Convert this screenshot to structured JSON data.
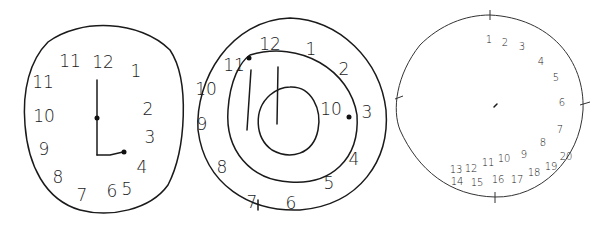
{
  "figure": {
    "clocks": [
      {
        "label": "clock-1",
        "numbers": [
          "12",
          "1",
          "2",
          "3",
          "4",
          "5",
          "6",
          "7",
          "8",
          "9",
          "10",
          "11",
          "11"
        ],
        "number_positions": [
          {
            "t": "12",
            "x": 103,
            "y": 63
          },
          {
            "t": "1",
            "x": 136,
            "y": 72
          },
          {
            "t": "2",
            "x": 148,
            "y": 110
          },
          {
            "t": "3",
            "x": 150,
            "y": 138
          },
          {
            "t": "4",
            "x": 142,
            "y": 168
          },
          {
            "t": "5",
            "x": 127,
            "y": 190
          },
          {
            "t": "6",
            "x": 112,
            "y": 192
          },
          {
            "t": "7",
            "x": 82,
            "y": 196
          },
          {
            "t": "8",
            "x": 58,
            "y": 178
          },
          {
            "t": "9",
            "x": 44,
            "y": 150
          },
          {
            "t": "10",
            "x": 44,
            "y": 117
          },
          {
            "t": "11",
            "x": 43,
            "y": 83
          },
          {
            "t": "11",
            "x": 70,
            "y": 62
          }
        ]
      },
      {
        "label": "clock-2",
        "numbers": [
          "12",
          "1",
          "2",
          "3",
          "4",
          "5",
          "6",
          "7",
          "8",
          "9",
          "10",
          "11",
          "10"
        ],
        "number_positions": [
          {
            "t": "12",
            "x": 270,
            "y": 45
          },
          {
            "t": "1",
            "x": 311,
            "y": 50
          },
          {
            "t": "2",
            "x": 344,
            "y": 70
          },
          {
            "t": "3",
            "x": 367,
            "y": 113
          },
          {
            "t": "4",
            "x": 354,
            "y": 160
          },
          {
            "t": "5",
            "x": 329,
            "y": 184
          },
          {
            "t": "6",
            "x": 291,
            "y": 204
          },
          {
            "t": "7",
            "x": 252,
            "y": 203
          },
          {
            "t": "8",
            "x": 222,
            "y": 168
          },
          {
            "t": "9",
            "x": 202,
            "y": 125
          },
          {
            "t": "10",
            "x": 206,
            "y": 90
          },
          {
            "t": "11",
            "x": 234,
            "y": 66
          },
          {
            "t": "10",
            "x": 331,
            "y": 110
          }
        ]
      },
      {
        "label": "clock-3",
        "numbers": [
          "1",
          "2",
          "3",
          "4",
          "5",
          "6",
          "7",
          "8",
          "9",
          "10",
          "11",
          "12",
          "13",
          "14",
          "15",
          "16",
          "17",
          "18",
          "19",
          "20"
        ],
        "number_positions": [
          {
            "t": "1",
            "x": 489,
            "y": 40
          },
          {
            "t": "2",
            "x": 505,
            "y": 43
          },
          {
            "t": "3",
            "x": 522,
            "y": 47
          },
          {
            "t": "4",
            "x": 541,
            "y": 62
          },
          {
            "t": "5",
            "x": 556,
            "y": 78
          },
          {
            "t": "6",
            "x": 562,
            "y": 103
          },
          {
            "t": "7",
            "x": 560,
            "y": 130
          },
          {
            "t": "8",
            "x": 543,
            "y": 143
          },
          {
            "t": "9",
            "x": 524,
            "y": 155
          },
          {
            "t": "10",
            "x": 504,
            "y": 159
          },
          {
            "t": "11",
            "x": 488,
            "y": 163
          },
          {
            "t": "12",
            "x": 471,
            "y": 169
          },
          {
            "t": "13",
            "x": 456,
            "y": 170
          },
          {
            "t": "14",
            "x": 457,
            "y": 182
          },
          {
            "t": "15",
            "x": 477,
            "y": 183
          },
          {
            "t": "16",
            "x": 498,
            "y": 180
          },
          {
            "t": "17",
            "x": 517,
            "y": 180
          },
          {
            "t": "18",
            "x": 534,
            "y": 173
          },
          {
            "t": "19",
            "x": 551,
            "y": 167
          },
          {
            "t": "20",
            "x": 566,
            "y": 157
          }
        ]
      }
    ]
  }
}
